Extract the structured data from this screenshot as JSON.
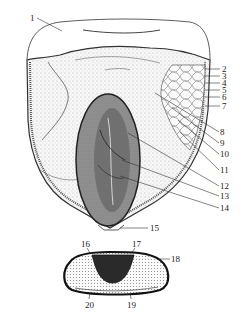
{
  "figure": {
    "colors": {
      "ink": "#222222",
      "background": "#ffffff",
      "fill_light": "#f2f2f2",
      "embryo_fill": "#8a8a8a",
      "embryo_dark": "#3a3a3a"
    }
  },
  "longitudinal_section": {
    "labels": [
      {
        "n": "1",
        "x": 30,
        "y": 14
      },
      {
        "n": "2",
        "x": 222,
        "y": 66
      },
      {
        "n": "3",
        "x": 222,
        "y": 74
      },
      {
        "n": "4",
        "x": 222,
        "y": 81
      },
      {
        "n": "5",
        "x": 222,
        "y": 88
      },
      {
        "n": "6",
        "x": 222,
        "y": 96
      },
      {
        "n": "7",
        "x": 222,
        "y": 104
      },
      {
        "n": "8",
        "x": 220,
        "y": 130
      },
      {
        "n": "9",
        "x": 220,
        "y": 141
      },
      {
        "n": "10",
        "x": 220,
        "y": 152
      },
      {
        "n": "11",
        "x": 220,
        "y": 168
      },
      {
        "n": "12",
        "x": 220,
        "y": 184
      },
      {
        "n": "13",
        "x": 220,
        "y": 194
      },
      {
        "n": "14",
        "x": 220,
        "y": 206
      },
      {
        "n": "15",
        "x": 150,
        "y": 226
      }
    ]
  },
  "cross_section": {
    "labels": [
      {
        "n": "16",
        "x": 81,
        "y": 240
      },
      {
        "n": "17",
        "x": 132,
        "y": 240
      },
      {
        "n": "18",
        "x": 171,
        "y": 256
      },
      {
        "n": "19",
        "x": 127,
        "y": 302
      },
      {
        "n": "20",
        "x": 85,
        "y": 302
      }
    ]
  }
}
